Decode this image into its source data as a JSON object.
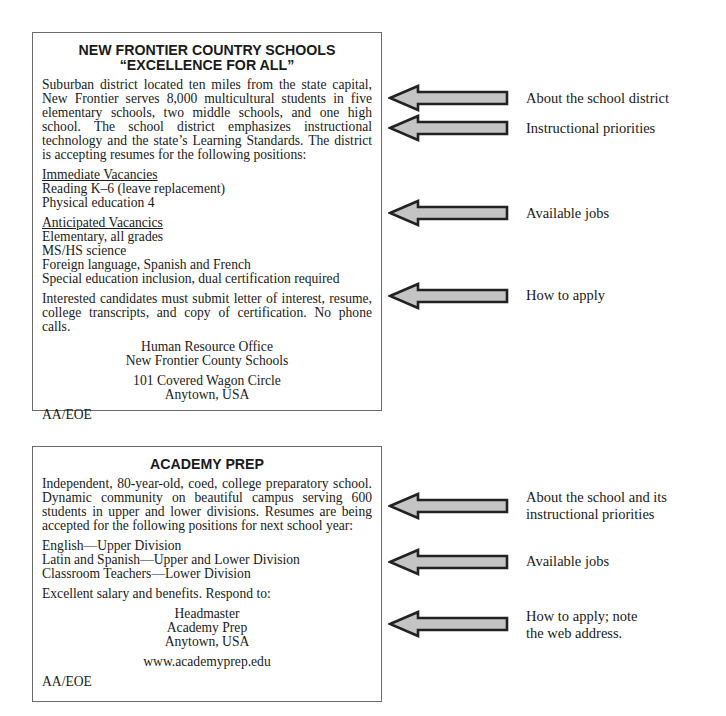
{
  "ad1": {
    "title_line1": "NEW FRONTIER COUNTRY SCHOOLS",
    "title_line2": "“EXCELLENCE FOR ALL”",
    "intro": "Suburban district located ten miles from the state capital, New Frontier serves 8,000 multicultural students in five elementary schools, two middle schools, and one high school. The school district emphasizes instructional technology and the state’s Learning Standards. The district is accepting resumes for the following positions:",
    "immediate_heading": "Immediate Vacancies",
    "immediate": [
      "Reading K–6 (leave replacement)",
      "Physical education 4"
    ],
    "anticipated_heading": "Anticipated Vacancics",
    "anticipated": [
      "Elementary, all grades",
      "MS/HS science",
      "Foreign language, Spanish and French",
      "Special education inclusion, dual certification required"
    ],
    "apply": "Interested candidates must submit letter of interest, resume, college transcripts, and copy of certification. No phone calls.",
    "office_line1": "Human Resource Office",
    "office_line2": "New Frontier County Schools",
    "address_line1": "101 Covered Wagon Circle",
    "address_line2": "Anytown, USA",
    "eoe": "AA/EOE"
  },
  "ad2": {
    "title": "ACADEMY PREP",
    "intro": "Independent, 80-year-old, coed, college preparatory school. Dynamic community on beautiful campus serving 600 students in upper and lower divisions. Resumes are being accepted for the following positions for next school year:",
    "jobs": [
      "English—Upper Division",
      "Latin and Spanish—Upper and Lower Division",
      "Classroom Teachers—Lower Division"
    ],
    "benefits": "Excellent salary and benefits. Respond to:",
    "contact_line1": "Headmaster",
    "contact_line2": "Academy Prep",
    "contact_line3": "Anytown, USA",
    "website": "www.academyprep.edu",
    "eoe": "AA/EOE"
  },
  "annotations": {
    "ad1": [
      {
        "label": "About the school district"
      },
      {
        "label": "Instructional priorities"
      },
      {
        "label": "Available jobs"
      },
      {
        "label": "How to apply"
      }
    ],
    "ad2": [
      {
        "line1": "About the school and its",
        "line2": "instructional priorities"
      },
      {
        "line1": "Available jobs"
      },
      {
        "line1": "How to apply; note",
        "line2": "the web address."
      }
    ]
  },
  "colors": {
    "arrow_fill": "#c4c4c4",
    "arrow_stroke": "#222222",
    "box_border": "#6a6a6a"
  }
}
